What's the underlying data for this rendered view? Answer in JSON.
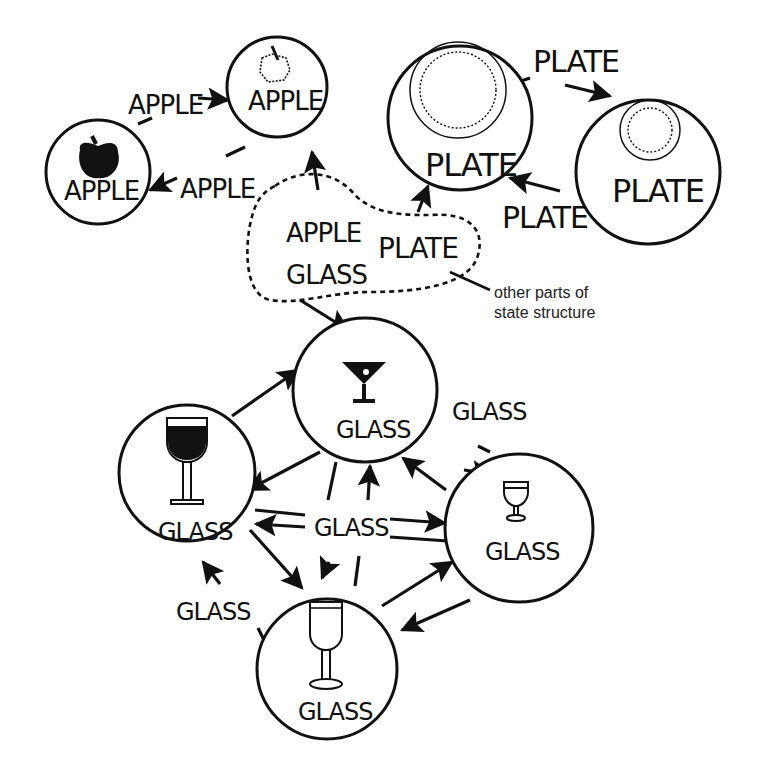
{
  "diagram": {
    "type": "state-structure graph",
    "nodes": [
      {
        "id": "apple-solid",
        "label": "APPLE",
        "icon": "solid-apple-icon"
      },
      {
        "id": "apple-outline",
        "label": "APPLE",
        "icon": "outline-apple-icon"
      },
      {
        "id": "plate-large",
        "label": "PLATE",
        "icon": "large-plate-icon"
      },
      {
        "id": "plate-small",
        "label": "PLATE",
        "icon": "small-plate-icon"
      },
      {
        "id": "glass-martini",
        "label": "GLASS",
        "icon": "martini-glass-icon"
      },
      {
        "id": "glass-wine-dark",
        "label": "GLASS",
        "icon": "red-wine-glass-icon"
      },
      {
        "id": "glass-small",
        "label": "GLASS",
        "icon": "small-goblet-icon"
      },
      {
        "id": "glass-tall",
        "label": "GLASS",
        "icon": "tall-wine-glass-icon"
      }
    ],
    "edge_labels": {
      "apple_top": "APPLE",
      "apple_bottom": "APPLE",
      "plate_top": "PLATE",
      "plate_bottom": "PLATE",
      "glass_right": "GLASS",
      "glass_center": "GLASS",
      "glass_left": "GLASS"
    },
    "region": {
      "labels": [
        "APPLE",
        "GLASS",
        "PLATE"
      ],
      "note_line1": "other parts of",
      "note_line2": "state structure"
    }
  }
}
